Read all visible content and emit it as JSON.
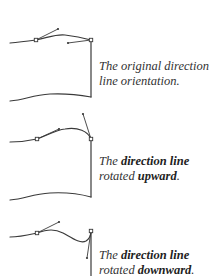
{
  "colors": {
    "stroke": "#3a3a3a",
    "text": "#333333"
  },
  "panels": [
    {
      "id": "original",
      "caption": {
        "line1": "The original direction",
        "line2": "line orientation."
      }
    },
    {
      "id": "upward",
      "caption": {
        "line1_prefix": "The ",
        "line1_bold": "direction line",
        "line2_prefix": "rotated ",
        "line2_bold": "upward",
        "line2_suffix": "."
      }
    },
    {
      "id": "downward",
      "caption": {
        "line1_prefix": "The ",
        "line1_bold": "direction line",
        "line2_prefix": "rotated ",
        "line2_bold": "downward",
        "line2_suffix": "."
      }
    }
  ]
}
